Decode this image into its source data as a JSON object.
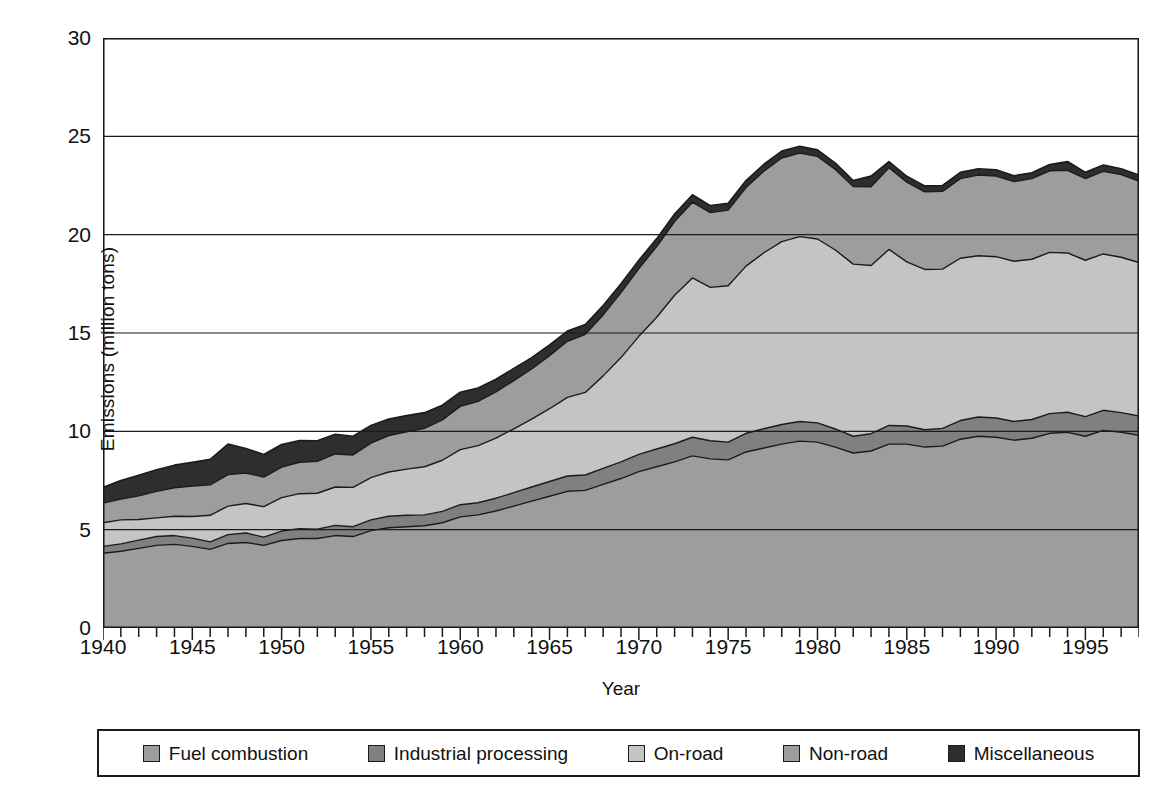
{
  "chart_data": {
    "type": "area",
    "stacked": true,
    "title": "",
    "xlabel": "Year",
    "ylabel": "Emissions (million tons)",
    "xlim": [
      1940,
      1998
    ],
    "ylim": [
      0,
      30
    ],
    "yticks": [
      0,
      5,
      10,
      15,
      20,
      25,
      30
    ],
    "xticks_labeled": [
      1940,
      1945,
      1950,
      1955,
      1960,
      1965,
      1970,
      1975,
      1980,
      1985,
      1990,
      1995
    ],
    "xtick_interval": 1,
    "grid": "horizontal",
    "legend_position": "below",
    "x": [
      1940,
      1941,
      1942,
      1943,
      1944,
      1945,
      1946,
      1947,
      1948,
      1949,
      1950,
      1951,
      1952,
      1953,
      1954,
      1955,
      1956,
      1957,
      1958,
      1959,
      1960,
      1961,
      1962,
      1963,
      1964,
      1965,
      1966,
      1967,
      1968,
      1969,
      1970,
      1971,
      1972,
      1973,
      1974,
      1975,
      1976,
      1977,
      1978,
      1979,
      1980,
      1981,
      1982,
      1983,
      1984,
      1985,
      1986,
      1987,
      1988,
      1989,
      1990,
      1991,
      1992,
      1993,
      1994,
      1995,
      1996,
      1997,
      1998
    ],
    "series": [
      {
        "name": "Fuel combustion",
        "color": "#9d9d9d",
        "values": [
          3.8,
          3.9,
          4.05,
          4.2,
          4.25,
          4.15,
          4.0,
          4.3,
          4.35,
          4.2,
          4.45,
          4.55,
          4.55,
          4.7,
          4.65,
          4.95,
          5.1,
          5.15,
          5.2,
          5.35,
          5.65,
          5.75,
          5.95,
          6.2,
          6.45,
          6.7,
          6.95,
          7.0,
          7.3,
          7.6,
          7.95,
          8.2,
          8.45,
          8.75,
          8.6,
          8.55,
          8.95,
          9.15,
          9.35,
          9.5,
          9.45,
          9.2,
          8.9,
          9.0,
          9.35,
          9.35,
          9.2,
          9.25,
          9.6,
          9.75,
          9.7,
          9.55,
          9.65,
          9.9,
          9.95,
          9.75,
          10.05,
          9.95,
          9.8
        ]
      },
      {
        "name": "Industrial processing",
        "color": "#808080",
        "values": [
          0.35,
          0.38,
          0.42,
          0.45,
          0.45,
          0.42,
          0.38,
          0.45,
          0.48,
          0.42,
          0.48,
          0.5,
          0.48,
          0.52,
          0.5,
          0.55,
          0.58,
          0.58,
          0.55,
          0.58,
          0.62,
          0.62,
          0.65,
          0.68,
          0.72,
          0.75,
          0.78,
          0.78,
          0.82,
          0.85,
          0.88,
          0.9,
          0.92,
          0.95,
          0.92,
          0.9,
          0.95,
          0.98,
          1.0,
          1.0,
          0.98,
          0.92,
          0.85,
          0.88,
          0.95,
          0.92,
          0.88,
          0.9,
          0.95,
          0.98,
          0.98,
          0.95,
          0.95,
          1.0,
          1.02,
          1.0,
          1.02,
          1.0,
          0.98
        ]
      },
      {
        "name": "On-road",
        "color": "#c4c4c4",
        "values": [
          1.2,
          1.22,
          1.05,
          0.95,
          0.98,
          1.1,
          1.35,
          1.45,
          1.5,
          1.55,
          1.7,
          1.78,
          1.82,
          1.95,
          2.0,
          2.15,
          2.25,
          2.35,
          2.45,
          2.6,
          2.8,
          2.9,
          3.05,
          3.25,
          3.45,
          3.7,
          4.0,
          4.2,
          4.7,
          5.3,
          6.0,
          6.7,
          7.55,
          8.1,
          7.8,
          7.95,
          8.5,
          8.95,
          9.3,
          9.4,
          9.35,
          9.1,
          8.75,
          8.55,
          8.95,
          8.35,
          8.15,
          8.1,
          8.25,
          8.2,
          8.2,
          8.15,
          8.15,
          8.2,
          8.1,
          7.95,
          7.95,
          7.9,
          7.8
        ]
      },
      {
        "name": "Non-road",
        "color": "#9d9d9d",
        "values": [
          1.0,
          1.05,
          1.2,
          1.35,
          1.45,
          1.55,
          1.55,
          1.6,
          1.55,
          1.5,
          1.55,
          1.6,
          1.62,
          1.68,
          1.65,
          1.75,
          1.85,
          1.9,
          1.95,
          2.05,
          2.2,
          2.25,
          2.35,
          2.45,
          2.55,
          2.7,
          2.85,
          2.95,
          3.1,
          3.3,
          3.45,
          3.6,
          3.75,
          3.85,
          3.8,
          3.85,
          4.0,
          4.15,
          4.25,
          4.25,
          4.2,
          4.1,
          3.95,
          4.0,
          4.15,
          4.05,
          3.95,
          3.95,
          4.05,
          4.1,
          4.1,
          4.05,
          4.1,
          4.15,
          4.2,
          4.15,
          4.2,
          4.2,
          4.15
        ]
      },
      {
        "name": "Miscellaneous",
        "color": "#2e2e2e",
        "values": [
          0.8,
          0.95,
          1.05,
          1.1,
          1.15,
          1.2,
          1.3,
          1.55,
          1.25,
          1.15,
          1.15,
          1.1,
          1.05,
          1.0,
          0.95,
          0.9,
          0.85,
          0.82,
          0.8,
          0.75,
          0.72,
          0.68,
          0.65,
          0.62,
          0.58,
          0.55,
          0.52,
          0.5,
          0.48,
          0.45,
          0.42,
          0.4,
          0.38,
          0.38,
          0.36,
          0.35,
          0.35,
          0.35,
          0.35,
          0.34,
          0.33,
          0.32,
          0.3,
          0.55,
          0.32,
          0.3,
          0.3,
          0.3,
          0.32,
          0.32,
          0.32,
          0.3,
          0.3,
          0.32,
          0.45,
          0.32,
          0.32,
          0.3,
          0.3
        ]
      }
    ]
  },
  "legend": {
    "items": [
      {
        "label": "Fuel combustion",
        "color": "#9d9d9d"
      },
      {
        "label": "Industrial processing",
        "color": "#808080"
      },
      {
        "label": "On-road",
        "color": "#c4c4c4"
      },
      {
        "label": "Non-road",
        "color": "#9d9d9d"
      },
      {
        "label": "Miscellaneous",
        "color": "#2e2e2e"
      }
    ]
  },
  "axes": {
    "y_title": "Emissions (million tons)",
    "x_title": "Year",
    "y_tick_labels": [
      "30",
      "25",
      "20",
      "15",
      "10",
      "5",
      "0"
    ],
    "x_tick_labels": [
      "1940",
      "1945",
      "1950",
      "1955",
      "1960",
      "1965",
      "1970",
      "1975",
      "1980",
      "1985",
      "1990",
      "1995"
    ]
  },
  "style": {
    "axis_color": "#1b1b1b",
    "grid_color": "#1b1b1b",
    "outline_color": "#1b1b1b",
    "background": "#ffffff"
  }
}
